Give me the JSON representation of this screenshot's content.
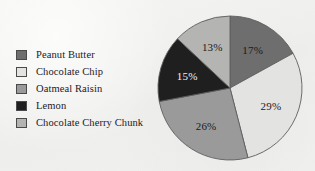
{
  "chart_data": {
    "type": "pie",
    "title": "",
    "categories": [
      "Peanut Butter",
      "Chocolate Chip",
      "Oatmeal Raisin",
      "Lemon",
      "Chocolate Cherry Chunk"
    ],
    "values": [
      17,
      29,
      26,
      15,
      13
    ],
    "value_suffix": "%",
    "data_labels": [
      "17%",
      "29%",
      "26%",
      "15%",
      "13%"
    ],
    "colors": [
      "#6e6e6e",
      "#e3e3e1",
      "#9a9a9a",
      "#1f1f1f",
      "#b4b4b2"
    ],
    "label_colors": [
      "#1a1a1a",
      "#1a1a1a",
      "#1a1a1a",
      "#f2f2f0",
      "#1a1a1a"
    ],
    "start_angle_deg": 0,
    "direction": "clockwise",
    "legend": {
      "position": "left",
      "entries": [
        {
          "label": "Peanut Butter",
          "color": "#6e6e6e"
        },
        {
          "label": "Chocolate Chip",
          "color": "#e3e3e1"
        },
        {
          "label": "Oatmeal Raisin",
          "color": "#9a9a9a"
        },
        {
          "label": "Lemon",
          "color": "#1f1f1f"
        },
        {
          "label": "Chocolate Cherry Chunk",
          "color": "#b4b4b2"
        }
      ]
    },
    "geometry": {
      "cx": 230,
      "cy": 88,
      "r": 72,
      "label_radius_ratio": 0.62
    }
  }
}
